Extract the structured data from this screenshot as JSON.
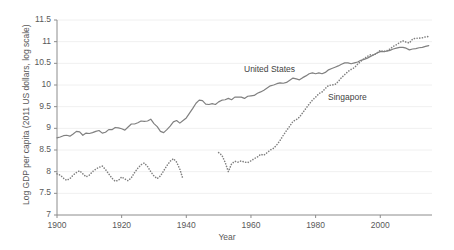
{
  "chart_data": {
    "type": "line",
    "title": "",
    "xlabel": "Year",
    "ylabel": "Log GDP per capita (2011 US dollars, log scale)",
    "xlim": [
      1900,
      2016
    ],
    "ylim": [
      7,
      11.5
    ],
    "xticks": [
      1900,
      1920,
      1940,
      1960,
      1980,
      2000
    ],
    "yticks": [
      7,
      7.5,
      8,
      8.5,
      9,
      9.5,
      10,
      10.5,
      11,
      11.5
    ],
    "ytick_labels": [
      "7",
      "7.5",
      "8",
      "8.5",
      "9",
      "9.5",
      "10",
      "10.5",
      "11",
      "11.5"
    ],
    "xtick_labels": [
      "1900",
      "1920",
      "1940",
      "1960",
      "1980",
      "2000"
    ],
    "grid": "horizontal-faint",
    "legend_position": "inline-annotation",
    "series": [
      {
        "name": "United States",
        "style": "solid",
        "color": "#808080",
        "label_x": 1962,
        "label_y": 10.18,
        "x": [
          1900,
          1901,
          1902,
          1903,
          1904,
          1905,
          1906,
          1907,
          1908,
          1909,
          1910,
          1911,
          1912,
          1913,
          1914,
          1915,
          1916,
          1917,
          1918,
          1919,
          1920,
          1921,
          1922,
          1923,
          1924,
          1925,
          1926,
          1927,
          1928,
          1929,
          1930,
          1931,
          1932,
          1933,
          1934,
          1935,
          1936,
          1937,
          1938,
          1939,
          1940,
          1941,
          1942,
          1943,
          1944,
          1945,
          1946,
          1947,
          1948,
          1949,
          1950,
          1951,
          1952,
          1953,
          1954,
          1955,
          1956,
          1957,
          1958,
          1959,
          1960,
          1961,
          1962,
          1963,
          1964,
          1965,
          1966,
          1967,
          1968,
          1969,
          1970,
          1971,
          1972,
          1973,
          1974,
          1975,
          1976,
          1977,
          1978,
          1979,
          1980,
          1981,
          1982,
          1983,
          1984,
          1985,
          1986,
          1987,
          1988,
          1989,
          1990,
          1991,
          1992,
          1993,
          1994,
          1995,
          1996,
          1997,
          1998,
          1999,
          2000,
          2001,
          2002,
          2003,
          2004,
          2005,
          2006,
          2007,
          2008,
          2009,
          2010,
          2011,
          2012,
          2013,
          2014,
          2015
        ],
        "y": [
          8.78,
          8.8,
          8.83,
          8.84,
          8.82,
          8.87,
          8.93,
          8.92,
          8.84,
          8.89,
          8.88,
          8.9,
          8.93,
          8.95,
          8.89,
          8.91,
          8.97,
          8.97,
          9.02,
          9.01,
          8.99,
          8.96,
          9.03,
          9.1,
          9.1,
          9.13,
          9.17,
          9.16,
          9.17,
          9.21,
          9.11,
          9.04,
          8.93,
          8.9,
          8.97,
          9.05,
          9.15,
          9.18,
          9.12,
          9.18,
          9.24,
          9.35,
          9.46,
          9.58,
          9.65,
          9.64,
          9.56,
          9.55,
          9.57,
          9.55,
          9.61,
          9.65,
          9.66,
          9.69,
          9.66,
          9.72,
          9.72,
          9.72,
          9.69,
          9.74,
          9.75,
          9.76,
          9.81,
          9.84,
          9.88,
          9.93,
          9.98,
          10.0,
          10.03,
          10.05,
          10.04,
          10.06,
          10.11,
          10.16,
          10.14,
          10.12,
          10.17,
          10.21,
          10.26,
          10.28,
          10.26,
          10.28,
          10.26,
          10.29,
          10.35,
          10.38,
          10.41,
          10.44,
          10.48,
          10.51,
          10.51,
          10.49,
          10.51,
          10.53,
          10.57,
          10.59,
          10.62,
          10.66,
          10.7,
          10.74,
          10.77,
          10.77,
          10.78,
          10.8,
          10.83,
          10.85,
          10.87,
          10.87,
          10.85,
          10.81,
          10.83,
          10.84,
          10.86,
          10.87,
          10.89,
          10.91
        ]
      },
      {
        "name": "Singapore",
        "style": "dotted",
        "color": "#808080",
        "label_x": 1984,
        "label_y": 9.8,
        "gap_years": [
          1940,
          1949
        ],
        "x": [
          1900,
          1901,
          1902,
          1903,
          1904,
          1905,
          1906,
          1907,
          1908,
          1909,
          1910,
          1911,
          1912,
          1913,
          1914,
          1915,
          1916,
          1917,
          1918,
          1919,
          1920,
          1921,
          1922,
          1923,
          1924,
          1925,
          1926,
          1927,
          1928,
          1929,
          1930,
          1931,
          1932,
          1933,
          1934,
          1935,
          1936,
          1937,
          1938,
          1939,
          1950,
          1951,
          1952,
          1953,
          1954,
          1955,
          1956,
          1957,
          1958,
          1959,
          1960,
          1961,
          1962,
          1963,
          1964,
          1965,
          1966,
          1967,
          1968,
          1969,
          1970,
          1971,
          1972,
          1973,
          1974,
          1975,
          1976,
          1977,
          1978,
          1979,
          1980,
          1981,
          1982,
          1983,
          1984,
          1985,
          1986,
          1987,
          1988,
          1989,
          1990,
          1991,
          1992,
          1993,
          1994,
          1995,
          1996,
          1997,
          1998,
          1999,
          2000,
          2001,
          2002,
          2003,
          2004,
          2005,
          2006,
          2007,
          2008,
          2009,
          2010,
          2011,
          2012,
          2013,
          2014,
          2015
        ],
        "y": [
          7.95,
          7.92,
          7.85,
          7.8,
          7.84,
          7.92,
          7.98,
          8.02,
          7.95,
          7.88,
          7.92,
          8.0,
          8.06,
          8.1,
          8.13,
          8.05,
          7.95,
          7.85,
          7.78,
          7.8,
          7.88,
          7.83,
          7.79,
          7.86,
          7.98,
          8.08,
          8.16,
          8.2,
          8.12,
          8.0,
          7.9,
          7.84,
          7.9,
          8.02,
          8.14,
          8.24,
          8.3,
          8.22,
          8.06,
          7.82,
          8.44,
          8.38,
          8.22,
          8.0,
          8.18,
          8.24,
          8.22,
          8.25,
          8.22,
          8.21,
          8.25,
          8.3,
          8.34,
          8.4,
          8.38,
          8.44,
          8.5,
          8.54,
          8.62,
          8.72,
          8.84,
          8.95,
          9.05,
          9.16,
          9.2,
          9.26,
          9.36,
          9.46,
          9.56,
          9.65,
          9.72,
          9.8,
          9.84,
          9.92,
          9.99,
          10.0,
          10.01,
          10.08,
          10.17,
          10.24,
          10.31,
          10.36,
          10.4,
          10.48,
          10.55,
          10.61,
          10.66,
          10.7,
          10.69,
          10.74,
          10.8,
          10.77,
          10.79,
          10.83,
          10.89,
          10.93,
          10.98,
          11.02,
          10.99,
          10.97,
          11.06,
          11.08,
          11.08,
          11.09,
          11.11,
          11.12
        ]
      }
    ]
  },
  "axes": {
    "x_title": "Year",
    "y_title": "Log GDP per capita (2011 US dollars, log scale)"
  }
}
